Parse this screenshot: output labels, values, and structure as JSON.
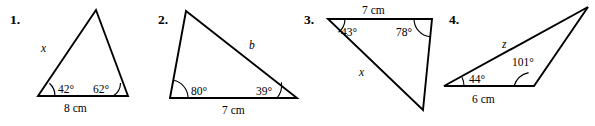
{
  "page": {
    "background_color": "#ffffff",
    "ink_color": "#000000"
  },
  "figures": [
    {
      "number": "1.",
      "angles": [
        "42°",
        "62°"
      ],
      "sides": [
        "8 cm"
      ],
      "variable": "x",
      "angle_left": "42°",
      "angle_right": "62°",
      "base_label": "8 cm"
    },
    {
      "number": "2.",
      "angles": [
        "80°",
        "39°"
      ],
      "sides": [
        "7 cm"
      ],
      "variable": "b",
      "angle_left": "80°",
      "angle_right": "39°",
      "base_label": "7 cm"
    },
    {
      "number": "3.",
      "angles": [
        "43°",
        "78°"
      ],
      "sides": [
        "7 cm"
      ],
      "variable": "x",
      "angle_left": "43°",
      "angle_right": "78°",
      "base_label": "7 cm"
    },
    {
      "number": "4.",
      "angles": [
        "44°",
        "101°"
      ],
      "sides": [
        "6 cm"
      ],
      "variable": "z",
      "angle_left": "44°",
      "angle_right": "101°",
      "base_label": "6 cm"
    }
  ]
}
